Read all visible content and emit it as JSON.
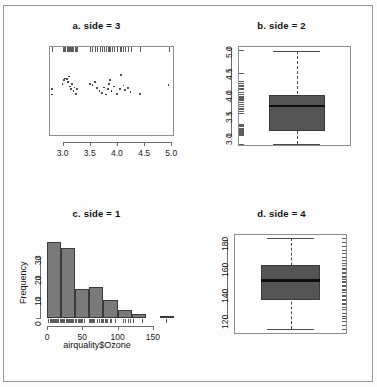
{
  "figure": {
    "panels": [
      "a. side = 3",
      "b. side = 2",
      "c. side = 1",
      "d. side = 4"
    ]
  },
  "chart_data": [
    {
      "id": "panel-a",
      "type": "scatter",
      "title": "a. side = 3",
      "xlabel": "",
      "ylabel": "",
      "xlim": [
        2.75,
        5.05
      ],
      "ylim": [
        0,
        1
      ],
      "xticks": [
        "3.0",
        "3.5",
        "4.0",
        "4.5",
        "5.0"
      ],
      "xtick_values": [
        3.0,
        3.5,
        4.0,
        4.5,
        5.0
      ],
      "yticks": [],
      "grid": false,
      "legend": "none",
      "rug_side": 3,
      "notes": "strip chart of values with rug marks drawn on the top axis (side = 3)",
      "x": [
        2.8,
        2.8,
        3.0,
        3.02,
        3.05,
        3.08,
        3.1,
        3.12,
        3.13,
        3.15,
        3.17,
        3.2,
        3.22,
        3.24,
        3.26,
        3.5,
        3.55,
        3.6,
        3.63,
        3.68,
        3.72,
        3.76,
        3.8,
        3.83,
        3.85,
        3.87,
        3.9,
        3.95,
        4.0,
        4.05,
        4.08,
        4.12,
        4.15,
        4.2,
        4.25,
        4.42,
        4.95
      ],
      "y": [
        0.46,
        0.52,
        0.58,
        0.62,
        0.64,
        0.63,
        0.6,
        0.66,
        0.55,
        0.52,
        0.58,
        0.5,
        0.54,
        0.47,
        0.52,
        0.58,
        0.57,
        0.6,
        0.53,
        0.5,
        0.48,
        0.54,
        0.46,
        0.52,
        0.58,
        0.62,
        0.5,
        0.55,
        0.47,
        0.52,
        0.68,
        0.56,
        0.51,
        0.53,
        0.49,
        0.47,
        0.57
      ]
    },
    {
      "id": "panel-b",
      "type": "boxplot",
      "title": "b. side = 2",
      "xlabel": "",
      "ylabel": "",
      "ylim": [
        2.75,
        5.05
      ],
      "yticks": [
        "5.0",
        "4.5",
        "4.0",
        "3.5",
        "3.0"
      ],
      "ytick_values": [
        5.0,
        4.5,
        4.0,
        3.5,
        3.0
      ],
      "grid": false,
      "legend": "none",
      "rug_side": 2,
      "box": {
        "lower_whisker": 2.8,
        "q1": 3.1,
        "median": 3.67,
        "q3": 3.93,
        "upper_whisker": 4.93
      },
      "box_fill": "#545454",
      "notes": "boxplot of the same values with rug marks on the left axis (side = 2)"
    },
    {
      "id": "panel-c",
      "type": "bar",
      "title": "c. side = 1",
      "xlabel": "airquality$Ozone",
      "ylabel": "Frequency",
      "xlim": [
        0,
        180
      ],
      "ylim": [
        0,
        40
      ],
      "xticks": [
        "0",
        "50",
        "100",
        "150"
      ],
      "xtick_values": [
        0,
        50,
        100,
        150
      ],
      "yticks": [
        "0",
        "10",
        "20",
        "30"
      ],
      "ytick_values": [
        0,
        10,
        20,
        30
      ],
      "grid": false,
      "legend": "none",
      "rug_side": 1,
      "bin_width": 20,
      "bin_edges": [
        0,
        20,
        40,
        60,
        80,
        100,
        120,
        140,
        160,
        180
      ],
      "categories": [
        "0-20",
        "20-40",
        "40-60",
        "60-80",
        "80-100",
        "100-120",
        "120-140",
        "140-160",
        "160-180"
      ],
      "values": [
        37,
        34,
        14,
        15,
        9,
        4,
        2,
        0,
        1
      ],
      "bar_fill": "#7a7a7a",
      "notes": "histogram of airquality$Ozone with rug marks on the bottom axis (side = 1)"
    },
    {
      "id": "panel-d",
      "type": "boxplot",
      "title": "d. side = 4",
      "xlabel": "",
      "ylabel": "",
      "ylim": [
        108,
        185
      ],
      "yticks": [
        "180",
        "160",
        "140",
        "120"
      ],
      "ytick_values": [
        180,
        160,
        140,
        120
      ],
      "grid": false,
      "legend": "none",
      "rug_side": 4,
      "box": {
        "lower_whisker": 112,
        "q1": 134,
        "median": 149,
        "q3": 161,
        "upper_whisker": 182
      },
      "box_fill": "#545454",
      "notes": "boxplot with rug marks on the right axis (side = 4)"
    }
  ]
}
